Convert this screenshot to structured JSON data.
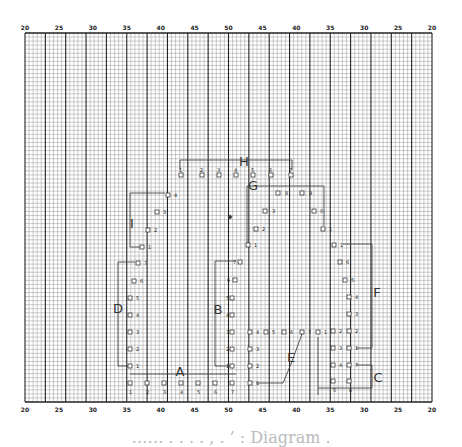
{
  "grid": {
    "left": 25,
    "right": 432,
    "top": 33,
    "bottom": 402,
    "minor_step": 4.07,
    "major_every": 5
  },
  "axis_top": {
    "labels": [
      "20",
      "25",
      "30",
      "35",
      "40",
      "45",
      "50",
      "45",
      "40",
      "35",
      "30",
      "25",
      "20"
    ]
  },
  "axis_bottom": {
    "labels": [
      "20",
      "25",
      "30",
      "35",
      "40",
      "45",
      "50",
      "45",
      "40",
      "35",
      "30",
      "25",
      "20"
    ]
  },
  "groups": [
    {
      "id": "A",
      "label": "A",
      "x": 180,
      "y": 376
    },
    {
      "id": "B",
      "label": "B",
      "x": 218,
      "y": 314
    },
    {
      "id": "C",
      "label": "C",
      "x": 378,
      "y": 382
    },
    {
      "id": "D",
      "label": "D",
      "x": 118,
      "y": 313
    },
    {
      "id": "E",
      "label": "E",
      "x": 291,
      "y": 362
    },
    {
      "id": "F",
      "label": "F",
      "x": 377,
      "y": 297
    },
    {
      "id": "G",
      "label": "G",
      "x": 253,
      "y": 190
    },
    {
      "id": "H",
      "label": "H",
      "x": 244,
      "y": 166
    },
    {
      "id": "I",
      "label": "I",
      "x": 132,
      "y": 228
    }
  ],
  "markers": [
    {
      "g": "H",
      "n": "1",
      "x": 181,
      "y": 175,
      "lx": 179,
      "ly": 172
    },
    {
      "g": "H",
      "n": "2",
      "x": 202,
      "y": 175,
      "lx": 200,
      "ly": 172
    },
    {
      "g": "H",
      "n": "3",
      "x": 219,
      "y": 175,
      "lx": 217,
      "ly": 172
    },
    {
      "g": "H",
      "n": "4",
      "x": 236,
      "y": 175,
      "lx": 234,
      "ly": 172
    },
    {
      "g": "H",
      "n": "5",
      "x": 253,
      "y": 175,
      "lx": 251,
      "ly": 172
    },
    {
      "g": "H",
      "n": "6",
      "x": 271,
      "y": 175,
      "lx": 269,
      "ly": 172
    },
    {
      "g": "H",
      "n": "7",
      "x": 291,
      "y": 175,
      "lx": 289,
      "ly": 172
    },
    {
      "g": "G",
      "n": "8",
      "x": 278,
      "y": 193,
      "lx": 285,
      "ly": 195
    },
    {
      "g": "G",
      "n": "9",
      "x": 302,
      "y": 193,
      "lx": 309,
      "ly": 195
    },
    {
      "g": "G",
      "n": "3",
      "x": 265,
      "y": 211,
      "lx": 272,
      "ly": 213
    },
    {
      "g": "G",
      "n": "0",
      "x": 314,
      "y": 211,
      "lx": 320,
      "ly": 213
    },
    {
      "g": "G",
      "n": "2",
      "x": 256,
      "y": 229,
      "lx": 262,
      "ly": 231
    },
    {
      "g": "G",
      "n": "1",
      "x": 323,
      "y": 229,
      "lx": 329,
      "ly": 231
    },
    {
      "g": "G",
      "n": "1",
      "x": 248,
      "y": 245,
      "lx": 254,
      "ly": 247
    },
    {
      "g": "I",
      "n": "4",
      "x": 168,
      "y": 195,
      "lx": 174,
      "ly": 197
    },
    {
      "g": "I",
      "n": "3",
      "x": 157,
      "y": 212,
      "lx": 163,
      "ly": 214
    },
    {
      "g": "I",
      "n": "2",
      "x": 148,
      "y": 230,
      "lx": 154,
      "ly": 232
    },
    {
      "g": "I",
      "n": "1",
      "x": 142,
      "y": 247,
      "lx": 148,
      "ly": 249
    },
    {
      "g": "D",
      "n": "7",
      "x": 138,
      "y": 263,
      "lx": 144,
      "ly": 265
    },
    {
      "g": "D",
      "n": "6",
      "x": 134,
      "y": 281,
      "lx": 140,
      "ly": 283
    },
    {
      "g": "D",
      "n": "5",
      "x": 130,
      "y": 298,
      "lx": 136,
      "ly": 300
    },
    {
      "g": "D",
      "n": "4",
      "x": 130,
      "y": 315,
      "lx": 136,
      "ly": 317
    },
    {
      "g": "D",
      "n": "3",
      "x": 130,
      "y": 332,
      "lx": 136,
      "ly": 334
    },
    {
      "g": "D",
      "n": "2",
      "x": 130,
      "y": 349,
      "lx": 136,
      "ly": 351
    },
    {
      "g": "D",
      "n": "1",
      "x": 130,
      "y": 366,
      "lx": 136,
      "ly": 368
    },
    {
      "g": "A",
      "n": "1",
      "x": 130,
      "y": 383,
      "lx": 129,
      "ly": 394
    },
    {
      "g": "A",
      "n": "2",
      "x": 147,
      "y": 383,
      "lx": 146,
      "ly": 394
    },
    {
      "g": "A",
      "n": "3",
      "x": 164,
      "y": 383,
      "lx": 163,
      "ly": 394
    },
    {
      "g": "A",
      "n": "4",
      "x": 181,
      "y": 383,
      "lx": 180,
      "ly": 394
    },
    {
      "g": "A",
      "n": "5",
      "x": 198,
      "y": 383,
      "lx": 197,
      "ly": 394
    },
    {
      "g": "A",
      "n": "6",
      "x": 215,
      "y": 383,
      "lx": 214,
      "ly": 394
    },
    {
      "g": "A",
      "n": "7",
      "x": 232,
      "y": 383,
      "lx": 231,
      "ly": 394
    },
    {
      "g": "B",
      "n": "7",
      "x": 240,
      "y": 262,
      "lx": 233,
      "ly": 264
    },
    {
      "g": "B",
      "n": "6",
      "x": 235,
      "y": 280,
      "lx": 227,
      "ly": 282
    },
    {
      "g": "B",
      "n": "5",
      "x": 232,
      "y": 298,
      "lx": 226,
      "ly": 300
    },
    {
      "g": "B",
      "n": "4",
      "x": 232,
      "y": 315,
      "lx": 226,
      "ly": 317
    },
    {
      "g": "B",
      "n": "3",
      "x": 232,
      "y": 332,
      "lx": 226,
      "ly": 334
    },
    {
      "g": "B",
      "n": "2",
      "x": 232,
      "y": 349,
      "lx": 226,
      "ly": 351
    },
    {
      "g": "B",
      "n": "1",
      "x": 232,
      "y": 366,
      "lx": 226,
      "ly": 368
    },
    {
      "g": "E",
      "n": "4",
      "x": 250,
      "y": 332,
      "lx": 256,
      "ly": 334
    },
    {
      "g": "E",
      "n": "5",
      "x": 266,
      "y": 332,
      "lx": 272,
      "ly": 334
    },
    {
      "g": "E",
      "n": "6",
      "x": 284,
      "y": 332,
      "lx": 290,
      "ly": 334
    },
    {
      "g": "E",
      "n": "7",
      "x": 302,
      "y": 332,
      "lx": 308,
      "ly": 334
    },
    {
      "g": "E",
      "n": "1",
      "x": 318,
      "y": 332,
      "lx": 324,
      "ly": 334
    },
    {
      "g": "E",
      "n": "3",
      "x": 250,
      "y": 349,
      "lx": 256,
      "ly": 351
    },
    {
      "g": "E",
      "n": "2",
      "x": 250,
      "y": 366,
      "lx": 256,
      "ly": 368
    },
    {
      "g": "E",
      "n": "1",
      "x": 250,
      "y": 383,
      "lx": 256,
      "ly": 385
    },
    {
      "g": "F",
      "n": "1",
      "x": 334,
      "y": 245,
      "lx": 340,
      "ly": 247
    },
    {
      "g": "F",
      "n": "6",
      "x": 340,
      "y": 262,
      "lx": 346,
      "ly": 264
    },
    {
      "g": "F",
      "n": "5",
      "x": 345,
      "y": 280,
      "lx": 351,
      "ly": 282
    },
    {
      "g": "F",
      "n": "4",
      "x": 349,
      "y": 297,
      "lx": 355,
      "ly": 299
    },
    {
      "g": "F",
      "n": "3",
      "x": 349,
      "y": 314,
      "lx": 355,
      "ly": 316
    },
    {
      "g": "F",
      "n": "2",
      "x": 349,
      "y": 331,
      "lx": 355,
      "ly": 333
    },
    {
      "g": "F",
      "n": "1",
      "x": 349,
      "y": 348,
      "lx": 355,
      "ly": 350
    },
    {
      "g": "C",
      "n": "2",
      "x": 333,
      "y": 331,
      "lx": 339,
      "ly": 333
    },
    {
      "g": "C",
      "n": "3",
      "x": 333,
      "y": 348,
      "lx": 339,
      "ly": 350
    },
    {
      "g": "C",
      "n": "4",
      "x": 333,
      "y": 365,
      "lx": 339,
      "ly": 367
    },
    {
      "g": "C",
      "n": "7",
      "x": 349,
      "y": 365,
      "lx": 355,
      "ly": 367
    },
    {
      "g": "C",
      "n": "5",
      "x": 333,
      "y": 381,
      "lx": 333,
      "ly": 392
    },
    {
      "g": "C",
      "n": "6",
      "x": 349,
      "y": 381,
      "lx": 349,
      "ly": 392
    }
  ],
  "diamond": {
    "x": 230,
    "y": 217
  },
  "caption": "……  .  .  .  .  ,  . ’  :  Diagram  ."
}
